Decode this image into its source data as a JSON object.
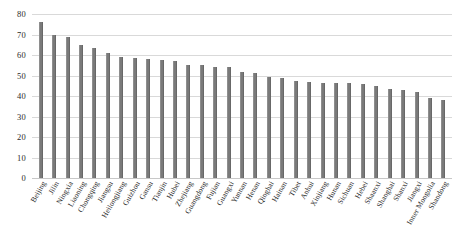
{
  "chart_data": {
    "type": "bar",
    "title": "",
    "xlabel": "",
    "ylabel": "",
    "ylim": [
      0,
      80
    ],
    "yticks": [
      0,
      10,
      20,
      30,
      40,
      50,
      60,
      70,
      80
    ],
    "grid": true,
    "legend": null,
    "bar_color": "#7a7a7a",
    "categories": [
      "Beijing",
      "Jilin",
      "Ningxia",
      "Liaoning",
      "Chongqing",
      "Jiangsu",
      "Heilongjiang",
      "Guizhou",
      "Gansu",
      "Tianjin",
      "Hubei",
      "Zhejiang",
      "Guangdong",
      "Fujian",
      "Guangxi",
      "Yunnan",
      "Henan",
      "Qinghai",
      "Hainan",
      "Tibet",
      "Anhui",
      "Xinjiang",
      "Hunan",
      "Sichuan",
      "Hebei",
      "Shaanxi",
      "Shanghai",
      "Shanxi",
      "Jiangxi",
      "Inner Mongolia",
      "Shandong"
    ],
    "values": [
      76,
      70,
      69,
      65,
      63.5,
      61,
      59,
      58.5,
      58,
      57.5,
      57,
      55,
      55,
      54,
      54,
      51.5,
      51,
      49.5,
      49,
      47.5,
      47,
      46.5,
      46.5,
      46.5,
      46,
      45,
      43.5,
      43,
      42,
      39,
      38
    ]
  },
  "caption": {
    "text": ""
  }
}
